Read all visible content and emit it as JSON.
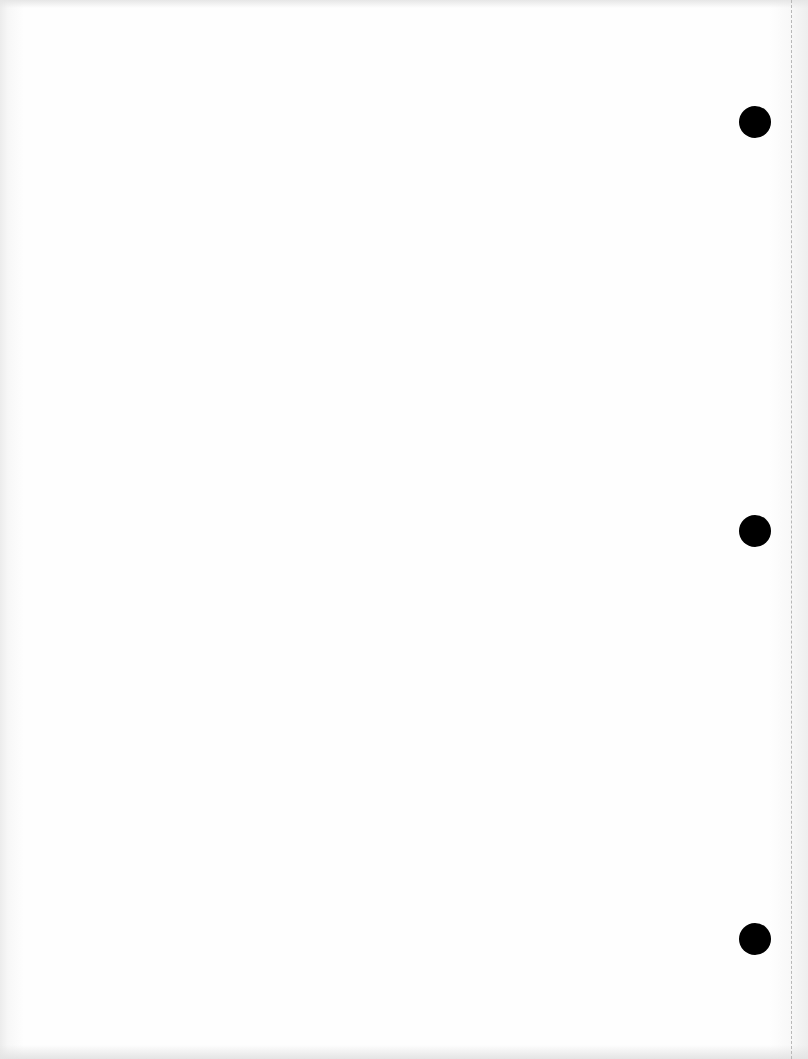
{
  "page": {
    "type": "blank scanned page",
    "text": ""
  },
  "holes": [
    {
      "name": "top-hole",
      "top": 106
    },
    {
      "name": "middle-hole",
      "top": 515
    },
    {
      "name": "bottom-hole",
      "top": 923
    }
  ],
  "colors": {
    "paper": "#fdfdfd",
    "hole": "#000000",
    "perforation": "#b8b8b8"
  }
}
